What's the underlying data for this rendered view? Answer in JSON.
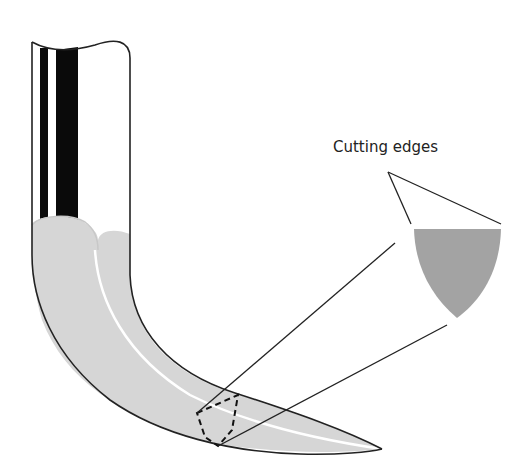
{
  "figure": {
    "labels": {
      "cutting_edges": "Cutting edges"
    },
    "colors": {
      "outline": "#222222",
      "needle_fill": "#d6d6d6",
      "cross_section_fill": "#a3a3a3",
      "stripe": "#0a0a0a",
      "highlight": "#ffffff"
    }
  }
}
